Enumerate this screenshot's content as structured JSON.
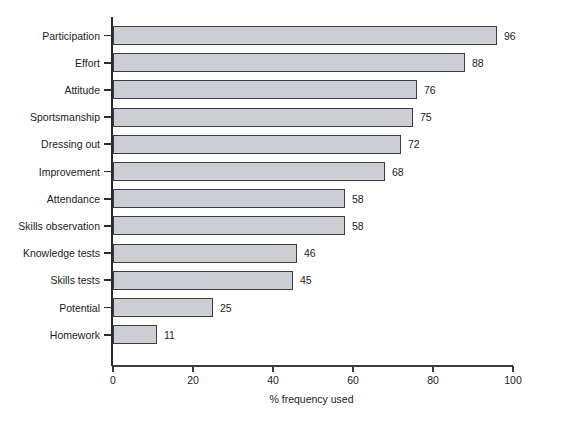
{
  "chart_data": {
    "type": "bar",
    "orientation": "horizontal",
    "title": "",
    "xlabel": "% frequency used",
    "ylabel": "",
    "xlim": [
      0,
      100
    ],
    "xticks": [
      0,
      20,
      40,
      60,
      80,
      100
    ],
    "grid": false,
    "legend": null,
    "bar_color": "#cdced3",
    "bar_edge_color": "#3c3c43",
    "axis_color": "#2b2b31",
    "background": "#ffffff",
    "categories": [
      "Participation",
      "Effort",
      "Attitude",
      "Sportsmanship",
      "Dressing out",
      "Improvement",
      "Attendance",
      "Skills observation",
      "Knowledge tests",
      "Skills tests",
      "Potential",
      "Homework"
    ],
    "values": [
      96,
      88,
      76,
      75,
      72,
      68,
      58,
      58,
      46,
      45,
      25,
      11
    ],
    "value_labels": [
      "96",
      "88",
      "76",
      "75",
      "72",
      "68",
      "58",
      "58",
      "46",
      "45",
      "25",
      "11"
    ],
    "xtick_labels": [
      "0",
      "20",
      "40",
      "60",
      "80",
      "100"
    ]
  }
}
